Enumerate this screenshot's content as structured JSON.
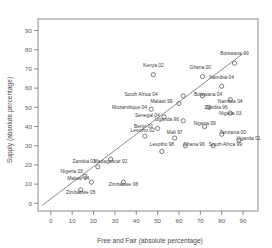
{
  "chart_data": {
    "type": "scatter",
    "title": "",
    "xlabel": "Free and Fair (absolute percentage)",
    "ylabel": "Supply (absolute percentage)",
    "xlim": [
      -6,
      97
    ],
    "ylim": [
      -4,
      96
    ],
    "xticks": [
      0,
      10,
      20,
      30,
      40,
      50,
      60,
      70,
      80,
      90
    ],
    "yticks": [
      0,
      10,
      20,
      30,
      40,
      50,
      60,
      70,
      80,
      90
    ],
    "grid": false,
    "legend": "none",
    "marker": "open-circle",
    "fit_line": {
      "label": "diagonal fit line",
      "x_start": -4,
      "y_start": -1,
      "x_end": 90,
      "y_end": 78
    },
    "points": [
      {
        "label": "Kenya 02",
        "x": 48,
        "y": 67,
        "lx": 48,
        "ly": 71,
        "anchor": "middle"
      },
      {
        "label": "Botswana 99",
        "x": 86,
        "y": 73,
        "lx": 86,
        "ly": 77,
        "anchor": "middle"
      },
      {
        "label": "Ghana 00",
        "x": 71,
        "y": 66,
        "lx": 70,
        "ly": 70,
        "anchor": "middle"
      },
      {
        "label": "Namibia 04",
        "x": 80,
        "y": 61,
        "lx": 80,
        "ly": 65,
        "anchor": "middle"
      },
      {
        "label": "South Africa 04",
        "x": 62,
        "y": 56,
        "lx": 50,
        "ly": 56,
        "anchor": "end"
      },
      {
        "label": "Botswana 04",
        "x": 71,
        "y": 56,
        "lx": 67,
        "ly": 56,
        "anchor": "start"
      },
      {
        "label": "Namibia 04",
        "x": 84,
        "y": 54,
        "lx": 84,
        "ly": 52,
        "anchor": "middle"
      },
      {
        "label": "Malawi 99",
        "x": 60,
        "y": 52,
        "lx": 57,
        "ly": 52,
        "anchor": "end"
      },
      {
        "label": "Mozambique 04",
        "x": 47,
        "y": 49,
        "lx": 45,
        "ly": 49,
        "anchor": "end"
      },
      {
        "label": "Zambia 96",
        "x": 74,
        "y": 50,
        "lx": 72,
        "ly": 49,
        "anchor": "start"
      },
      {
        "label": "Nigeria 03",
        "x": 84,
        "y": 47,
        "lx": 84,
        "ly": 46,
        "anchor": "middle"
      },
      {
        "label": "Senegal 04",
        "x": 53,
        "y": 45,
        "lx": 51,
        "ly": 45,
        "anchor": "end"
      },
      {
        "label": "Uganda 96",
        "x": 62,
        "y": 43,
        "lx": 60,
        "ly": 43,
        "anchor": "end"
      },
      {
        "label": "Nigeria 99",
        "x": 72,
        "y": 40,
        "lx": 72,
        "ly": 41,
        "anchor": "middle"
      },
      {
        "label": "Benin 01",
        "x": 50,
        "y": 39,
        "lx": 48,
        "ly": 39,
        "anchor": "end"
      },
      {
        "label": "Tanzania 00",
        "x": 80,
        "y": 36,
        "lx": 79,
        "ly": 36,
        "anchor": "start"
      },
      {
        "label": "Uganda 01",
        "x": 88,
        "y": 33,
        "lx": 87,
        "ly": 33,
        "anchor": "start"
      },
      {
        "label": "Lesotho 02",
        "x": 44,
        "y": 35,
        "lx": 43,
        "ly": 37,
        "anchor": "middle"
      },
      {
        "label": "Mali 97",
        "x": 58,
        "y": 34,
        "lx": 58,
        "ly": 36,
        "anchor": "middle"
      },
      {
        "label": "Ghana 96",
        "x": 63,
        "y": 30,
        "lx": 62,
        "ly": 30,
        "anchor": "start"
      },
      {
        "label": "South Africa 99",
        "x": 76,
        "y": 30,
        "lx": 74,
        "ly": 30,
        "anchor": "start"
      },
      {
        "label": "Lesotho 98",
        "x": 52,
        "y": 27,
        "lx": 52,
        "ly": 30,
        "anchor": "middle"
      },
      {
        "label": "Madagascar 02",
        "x": 28,
        "y": 23,
        "lx": 28,
        "ly": 21,
        "anchor": "middle"
      },
      {
        "label": "Zambia 03",
        "x": 22,
        "y": 19,
        "lx": 21,
        "ly": 21,
        "anchor": "end"
      },
      {
        "label": "Nigeria 03",
        "x": 16,
        "y": 14,
        "lx": 15,
        "ly": 16,
        "anchor": "end"
      },
      {
        "label": "Malawi 04",
        "x": 19,
        "y": 11,
        "lx": 18,
        "ly": 12,
        "anchor": "end"
      },
      {
        "label": "Zimbabwe 96",
        "x": 34,
        "y": 11,
        "lx": 34,
        "ly": 9,
        "anchor": "middle"
      },
      {
        "label": "Zimbabwe 05",
        "x": 14,
        "y": 7,
        "lx": 14,
        "ly": 5,
        "anchor": "middle"
      }
    ]
  }
}
